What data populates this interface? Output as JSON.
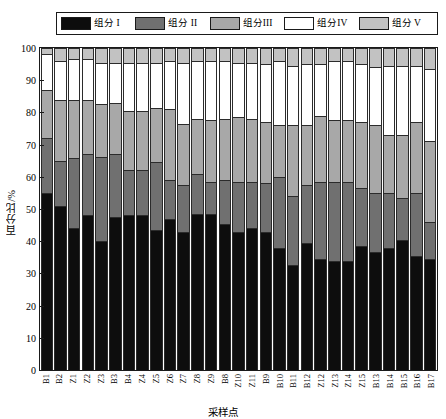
{
  "chart_data": {
    "type": "bar",
    "subtype": "stacked-bar-100",
    "title": "",
    "xlabel": "采样点",
    "ylabel": "百分比/%",
    "ylim": [
      0,
      100
    ],
    "yticks": [
      0,
      10,
      20,
      30,
      40,
      50,
      60,
      70,
      80,
      90,
      100
    ],
    "grid": false,
    "legend_position": "top",
    "categories": [
      "B1",
      "B2",
      "Z1",
      "Z2",
      "Z3",
      "B3",
      "B4",
      "Z4",
      "Z5",
      "Z6",
      "Z7",
      "Z8",
      "Z9",
      "B8",
      "Z10",
      "Z11",
      "B9",
      "B10",
      "B11",
      "B12",
      "Z12",
      "Z13",
      "Z14",
      "Z15",
      "B13",
      "B14",
      "B15",
      "B16",
      "B17"
    ],
    "series": [
      {
        "name": "组分 I",
        "color": "#0d0d0d",
        "values": [
          55.0,
          51.0,
          44.0,
          48.0,
          40.0,
          47.5,
          48.0,
          48.0,
          43.5,
          47.0,
          43.0,
          48.5,
          48.5,
          45.5,
          43.0,
          44.0,
          43.0,
          38.0,
          32.5,
          39.5,
          34.5,
          34.0,
          34.0,
          38.5,
          36.5,
          38.0,
          40.5,
          35.5,
          34.5
        ]
      },
      {
        "name": "组分 II",
        "color": "#707070",
        "values": [
          17.0,
          14.0,
          22.0,
          19.0,
          26.0,
          19.5,
          14.0,
          14.0,
          21.0,
          12.0,
          14.5,
          12.5,
          10.0,
          13.5,
          15.5,
          14.5,
          15.0,
          22.0,
          21.5,
          18.0,
          24.0,
          24.5,
          24.5,
          18.0,
          18.5,
          17.0,
          13.0,
          19.5,
          11.5
        ]
      },
      {
        "name": "组分III",
        "color": "#a8a8a8",
        "values": [
          15.0,
          19.0,
          18.0,
          17.0,
          16.5,
          16.0,
          18.5,
          18.5,
          17.0,
          22.0,
          19.0,
          17.0,
          19.0,
          19.0,
          20.0,
          19.5,
          19.0,
          16.0,
          22.0,
          18.5,
          20.5,
          19.0,
          19.0,
          20.5,
          21.0,
          18.0,
          19.5,
          22.0,
          25.0
        ]
      },
      {
        "name": "组分IV",
        "color": "#ffffff",
        "values": [
          11.0,
          12.0,
          12.5,
          12.5,
          13.0,
          12.5,
          15.0,
          15.0,
          14.0,
          15.0,
          19.0,
          18.0,
          18.5,
          18.0,
          17.0,
          17.5,
          18.0,
          20.0,
          18.5,
          19.0,
          16.0,
          18.5,
          18.5,
          18.0,
          18.0,
          21.5,
          21.5,
          17.5,
          22.5
        ]
      },
      {
        "name": "组分 V",
        "color": "#c2c2c2",
        "values": [
          2.0,
          4.0,
          3.5,
          3.5,
          4.5,
          4.5,
          4.5,
          4.5,
          4.5,
          4.0,
          4.5,
          4.0,
          4.0,
          4.0,
          4.5,
          4.5,
          5.0,
          4.0,
          5.5,
          5.0,
          5.0,
          4.0,
          4.0,
          5.0,
          6.0,
          5.5,
          5.5,
          5.5,
          6.5
        ]
      }
    ]
  },
  "legend": {
    "items": [
      {
        "label": "组分 I",
        "color": "#0d0d0d"
      },
      {
        "label": "组分 II",
        "color": "#707070"
      },
      {
        "label": "组分III",
        "color": "#a8a8a8"
      },
      {
        "label": "组分IV",
        "color": "#ffffff"
      },
      {
        "label": "组分 V",
        "color": "#c2c2c2"
      }
    ]
  }
}
